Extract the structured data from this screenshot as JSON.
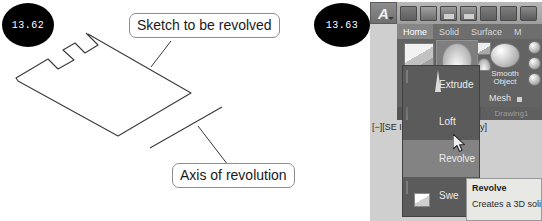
{
  "figures": [
    {
      "badge": "13.62",
      "labels": {
        "sketch": "Sketch to be revolved",
        "axis": "Axis of revolution"
      }
    },
    {
      "badge": "13.63"
    }
  ],
  "cad": {
    "quick_access": {
      "app_menu": "A",
      "icons": [
        "new-file-icon",
        "open-folder-icon",
        "save-icon",
        "save-as-icon",
        "export-icon",
        "undo-icon",
        "print-icon"
      ]
    },
    "tabs": [
      {
        "label": "Home",
        "active": true
      },
      {
        "label": "Solid",
        "active": false
      },
      {
        "label": "Surface",
        "active": false
      },
      {
        "label": "M",
        "active": false
      }
    ],
    "ribbon_buttons": [
      {
        "label": "Box",
        "highlighted": false
      },
      {
        "label": "Revolve",
        "highlighted": true
      },
      {
        "label": "Smooth\nObject",
        "highlighted": false
      }
    ],
    "button_labels": {
      "box": "Box",
      "revolve": "Revolve",
      "smooth_object_line1": "Smooth",
      "smooth_object_line2": "Object"
    },
    "panel_labels": {
      "modeling": "M",
      "mesh": "Mesh",
      "solid": "So",
      "drawing_tab": "Drawing1"
    },
    "viewport_label": {
      "left": "[−][SE Is",
      "right": "of Gray]"
    },
    "flyout": {
      "items": [
        {
          "label": "Extrude",
          "highlighted": false
        },
        {
          "label": "Loft",
          "highlighted": false
        },
        {
          "label": "Revolve",
          "highlighted": true
        },
        {
          "label": "Swe",
          "highlighted": false
        }
      ],
      "item_labels": {
        "extrude": "Extrude",
        "loft": "Loft",
        "revolve": "Revolve",
        "sweep": "Swe"
      }
    },
    "tooltip": {
      "title": "Revolve",
      "description": "Creates a 3D solid or"
    }
  },
  "colors": {
    "badge_background": "#000000",
    "badge_text": "#ffffff",
    "ribbon_background": "#636363",
    "ribbon_highlight": "#7e7e7e",
    "flyout_background": "#5b5b5b",
    "flyout_highlight": "#838383",
    "tooltip_background": "#e8e8e4",
    "line_color": "#3a3a3a",
    "label_border": "#8d8d8d"
  }
}
